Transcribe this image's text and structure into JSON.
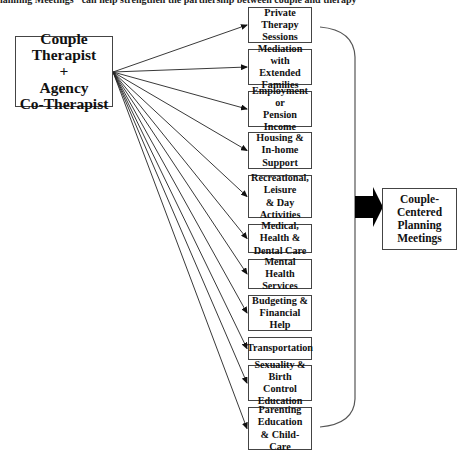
{
  "header": {
    "text": "lanning Meetings\" can help strengthen the partnership between couple and therapy"
  },
  "source_box": {
    "lines": [
      "Couple",
      "Therapist",
      "+",
      "Agency",
      "Co-Therapist"
    ]
  },
  "services": [
    {
      "id": "private-therapy",
      "lines": [
        "Private Therapy",
        "Sessions"
      ],
      "top": 7,
      "height": 36
    },
    {
      "id": "mediation",
      "lines": [
        "Mediation with",
        "Extended Families"
      ],
      "top": 49,
      "height": 36
    },
    {
      "id": "employment",
      "lines": [
        "Employment or",
        "Pension Income"
      ],
      "top": 91,
      "height": 36
    },
    {
      "id": "housing",
      "lines": [
        "Housing &",
        "In-home Support"
      ],
      "top": 132,
      "height": 37
    },
    {
      "id": "recreational",
      "lines": [
        "Recreational,",
        "Leisure",
        "& Day Activities"
      ],
      "top": 175,
      "height": 43
    },
    {
      "id": "medical",
      "lines": [
        "Medical, Health &",
        "Dental Care"
      ],
      "top": 224,
      "height": 29
    },
    {
      "id": "mental-health",
      "lines": [
        "Mental Health",
        "Services"
      ],
      "top": 259,
      "height": 30
    },
    {
      "id": "budgeting",
      "lines": [
        "Budgeting &",
        "Financial Help"
      ],
      "top": 295,
      "height": 36
    },
    {
      "id": "transportation",
      "lines": [
        "Transportation"
      ],
      "top": 337,
      "height": 23
    },
    {
      "id": "sexuality",
      "lines": [
        "Sexuality & Birth",
        "Control Education"
      ],
      "top": 365,
      "height": 36
    },
    {
      "id": "parenting",
      "lines": [
        "Parenting",
        "Education",
        "& Child-Care"
      ],
      "top": 407,
      "height": 43
    }
  ],
  "destination_box": {
    "lines": [
      "Couple-",
      "Centered",
      "Planning",
      "Meetings"
    ]
  },
  "colors": {
    "line": "#222222",
    "border": "#444444",
    "bracket": "#555555",
    "arrow": "#000000"
  }
}
